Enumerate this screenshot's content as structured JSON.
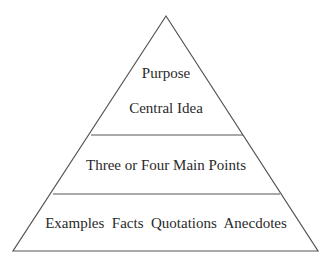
{
  "diagram": {
    "type": "pyramid",
    "levels": [
      {
        "id": "top",
        "lines": [
          "Purpose",
          "Central Idea"
        ]
      },
      {
        "id": "middle",
        "lines": [
          "Three or Four Main Points"
        ]
      },
      {
        "id": "bottom",
        "lines": [
          "Examples  Facts  Quotations  Anecdotes"
        ]
      }
    ],
    "colors": {
      "stroke": "#555555",
      "text": "#2a2a2a",
      "background": "#ffffff"
    }
  }
}
